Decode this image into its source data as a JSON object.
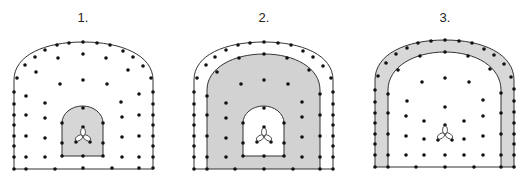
{
  "figure": {
    "panels": [
      {
        "label": "1.",
        "label_x": 83,
        "shaded_region": "inner-arch",
        "outer": {
          "left": 14,
          "right": 153,
          "top": 42,
          "spring": 80,
          "bottom": 169
        },
        "middle": null,
        "inner": {
          "left": 62,
          "right": 103,
          "top": 108,
          "spring": 123,
          "bottom": 156
        },
        "center_x": 83
      },
      {
        "label": "2.",
        "label_x": 264,
        "shaded_region": "between-middle-and-inner",
        "outer": {
          "left": 194,
          "right": 333,
          "top": 42,
          "spring": 80,
          "bottom": 169
        },
        "middle": {
          "left": 207,
          "right": 320,
          "top": 54,
          "spring": 95,
          "bottom": 169
        },
        "inner": {
          "left": 243,
          "right": 284,
          "top": 108,
          "spring": 123,
          "bottom": 156
        },
        "center_x": 264
      },
      {
        "label": "3.",
        "label_x": 445,
        "shaded_region": "outer-ring",
        "outer": {
          "left": 375,
          "right": 514,
          "top": 40,
          "spring": 80,
          "bottom": 167
        },
        "middle": {
          "left": 388,
          "right": 501,
          "top": 52,
          "spring": 95,
          "bottom": 167
        },
        "inner": null,
        "center_x": 445
      }
    ],
    "colors": {
      "line": "#333333",
      "dot": "#111111",
      "shade": "#d4d4d4"
    }
  }
}
